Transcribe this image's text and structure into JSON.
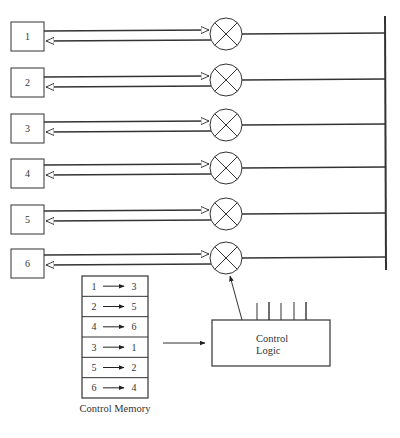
{
  "ports": [
    {
      "label": "1"
    },
    {
      "label": "2"
    },
    {
      "label": "3"
    },
    {
      "label": "4"
    },
    {
      "label": "5"
    },
    {
      "label": "6"
    }
  ],
  "control_memory": {
    "title": "Control Memory",
    "entries": [
      {
        "from": "1",
        "to": "3"
      },
      {
        "from": "2",
        "to": "5"
      },
      {
        "from": "4",
        "to": "6"
      },
      {
        "from": "3",
        "to": "1"
      },
      {
        "from": "5",
        "to": "2"
      },
      {
        "from": "6",
        "to": "4"
      }
    ]
  },
  "control_logic": {
    "line1": "Control",
    "line2": "Logic"
  },
  "icons": {
    "crosspoint": "circle-x-icon",
    "arrow": "right-arrow-icon"
  },
  "colors": {
    "stroke": "#333333",
    "background": "#ffffff"
  }
}
